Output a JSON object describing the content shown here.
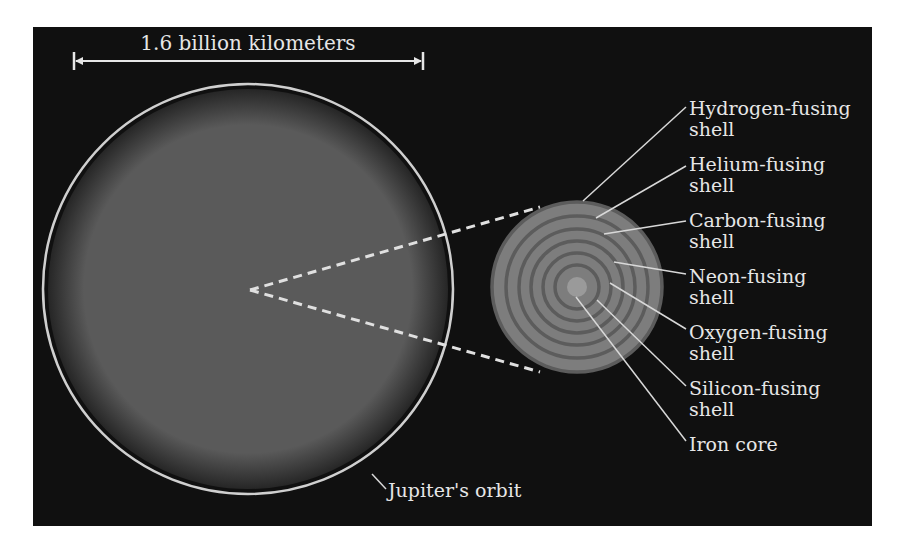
{
  "diagram": {
    "panel": {
      "x": 33,
      "y": 27,
      "w": 839,
      "h": 499,
      "color": "#101010"
    },
    "scale_bar": {
      "label": "1.6 billion kilometers",
      "x1": 74,
      "x2": 423,
      "y": 61,
      "label_x": 248,
      "label_y": 50
    },
    "supergiant": {
      "cx": 248,
      "cy": 289,
      "orbit_r": 205,
      "orbit_color": "#cfcfcf",
      "envelope_r": 200,
      "envelope_inner_color": "#5a5a5a",
      "envelope_edge_color": "#262626",
      "orbit_label": "Jupiter's orbit",
      "orbit_label_x": 388,
      "orbit_label_y": 497,
      "orbit_leader": {
        "x1": 372,
        "y1": 474,
        "x2": 386,
        "y2": 489
      }
    },
    "zoom_lines": {
      "apex": {
        "x": 250,
        "y": 290
      },
      "top_end": {
        "x": 540,
        "y": 207
      },
      "bottom_end": {
        "x": 540,
        "y": 372
      },
      "color": "#e0e0e0"
    },
    "core_star": {
      "cx": 577,
      "cy": 287,
      "r": 85,
      "shell_radii": [
        85,
        71,
        58,
        46,
        34,
        22
      ],
      "shell_fill": "#7d7d7d",
      "shell_gap": "#5c5c5c",
      "core_r": 10,
      "core_color": "#9a9a9a"
    },
    "labels": [
      {
        "line1": "Hydrogen-fusing",
        "line2": "shell",
        "x": 689,
        "y": 115,
        "leader": {
          "x1": 583,
          "y1": 201,
          "x2": 686,
          "y2": 107
        }
      },
      {
        "line1": "Helium-fusing",
        "line2": "shell",
        "x": 689,
        "y": 171,
        "leader": {
          "x1": 596,
          "y1": 218,
          "x2": 686,
          "y2": 166
        }
      },
      {
        "line1": "Carbon-fusing",
        "line2": "shell",
        "x": 689,
        "y": 227,
        "leader": {
          "x1": 604,
          "y1": 234,
          "x2": 686,
          "y2": 221
        }
      },
      {
        "line1": "Neon-fusing",
        "line2": "shell",
        "x": 689,
        "y": 283,
        "leader": {
          "x1": 614,
          "y1": 262,
          "x2": 686,
          "y2": 274
        }
      },
      {
        "line1": "Oxygen-fusing",
        "line2": "shell",
        "x": 689,
        "y": 339,
        "leader": {
          "x1": 610,
          "y1": 283,
          "x2": 686,
          "y2": 329
        }
      },
      {
        "line1": "Silicon-fusing",
        "line2": "shell",
        "x": 689,
        "y": 395,
        "leader": {
          "x1": 597,
          "y1": 300,
          "x2": 686,
          "y2": 386
        }
      },
      {
        "line1": "Iron core",
        "line2": "",
        "x": 689,
        "y": 451,
        "leader": {
          "x1": 576,
          "y1": 297,
          "x2": 686,
          "y2": 441
        }
      }
    ],
    "text_color": "#e6e6e6",
    "leader_color": "#d8d8d8"
  }
}
